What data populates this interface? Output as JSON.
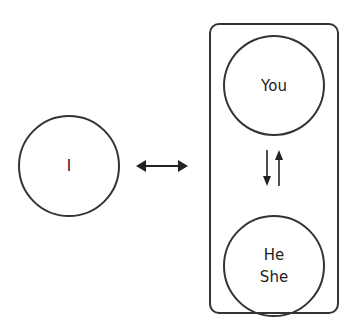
{
  "diagram": {
    "left_node": {
      "label": "I"
    },
    "group": {
      "top_node": {
        "label": "You"
      },
      "bottom_node": {
        "lines": [
          "He",
          "She"
        ]
      },
      "connector": "vertical-bidirectional-arrows"
    },
    "connector": "horizontal-bidirectional-arrow"
  },
  "colors": {
    "stroke": "#333333",
    "text": "#222222",
    "background": "#ffffff"
  }
}
